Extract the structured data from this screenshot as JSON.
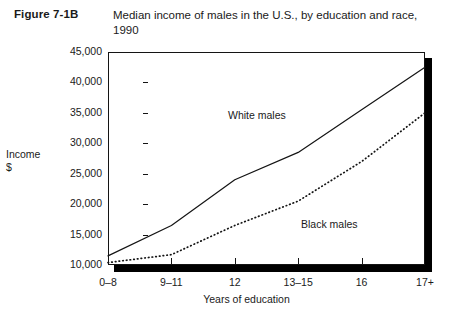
{
  "figure": {
    "number": "Figure 7-1B",
    "title": "Median income of males in the U.S., by education and race, 1990"
  },
  "chart_data": {
    "type": "line",
    "title": "Median income of males in the U.S., by education and race, 1990",
    "xlabel": "Years of education",
    "ylabel": "Income $",
    "categories": [
      "0–8",
      "9–11",
      "12",
      "13–15",
      "16",
      "17+"
    ],
    "yticks": [
      "10,000",
      "15,000",
      "20,000",
      "25,000",
      "30,000",
      "35,000",
      "40,000",
      "45,000"
    ],
    "ytick_values": [
      10000,
      15000,
      20000,
      25000,
      30000,
      35000,
      40000,
      45000
    ],
    "ylim": [
      10000,
      45000
    ],
    "grid": false,
    "legend_position": "inline-annotations",
    "series": [
      {
        "name": "White males",
        "style": "solid",
        "color": "#141414",
        "values": [
          11500,
          16500,
          24000,
          28500,
          35500,
          42500
        ]
      },
      {
        "name": "Black males",
        "style": "dotted",
        "color": "#141414",
        "values": [
          10400,
          11700,
          16500,
          20500,
          27000,
          35000
        ]
      }
    ]
  },
  "axis": {
    "y_title_line1": "Income",
    "y_title_line2": "$",
    "x_title": "Years of education"
  }
}
